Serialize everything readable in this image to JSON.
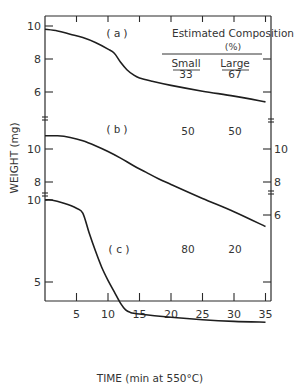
{
  "chart_data": {
    "type": "line",
    "title": "",
    "xlabel": "TIME (min at 550°C)",
    "ylabel": "WEIGHT (mg)",
    "x_ticks": [
      5,
      10,
      15,
      20,
      25,
      30,
      35
    ],
    "xlim": [
      0,
      35
    ],
    "grid": false,
    "legend": {
      "header": "Estimated Composition",
      "unit": "(%)",
      "columns": [
        "Small",
        "Large"
      ]
    },
    "panels": [
      {
        "label": "(a)",
        "composition": {
          "small": "33",
          "large": "67"
        },
        "left_ticks": [
          10,
          8,
          6
        ],
        "right_ticks": [],
        "ylim": [
          4.5,
          10.5
        ],
        "x": [
          0,
          2,
          4,
          6,
          8,
          10,
          11,
          12,
          13,
          14,
          15,
          17,
          20,
          25,
          30,
          35
        ],
        "y": [
          9.8,
          9.7,
          9.5,
          9.3,
          9.0,
          8.6,
          8.35,
          7.8,
          7.35,
          7.05,
          6.85,
          6.65,
          6.4,
          6.05,
          5.75,
          5.4
        ]
      },
      {
        "label": "(b)",
        "composition": {
          "small": "50",
          "large": "50"
        },
        "left_ticks": [
          10,
          8
        ],
        "right_ticks": [
          10,
          8,
          6
        ],
        "ylim": [
          7.5,
          11.5
        ],
        "x": [
          0,
          2,
          4,
          6,
          8,
          10,
          12,
          14,
          16,
          18,
          20,
          25,
          30,
          35
        ],
        "y": [
          10.8,
          10.8,
          10.7,
          10.5,
          10.2,
          9.85,
          9.45,
          9.0,
          8.6,
          8.2,
          7.85,
          7.0,
          6.2,
          5.3
        ]
      },
      {
        "label": "(c)",
        "composition": {
          "small": "80",
          "large": "20"
        },
        "left_ticks": [
          10,
          5
        ],
        "right_ticks": [],
        "ylim": [
          3,
          10.5
        ],
        "x": [
          0,
          1,
          3,
          5,
          6,
          7,
          8,
          9,
          10,
          11,
          12,
          12.8,
          13.5,
          15,
          20,
          25,
          30,
          35
        ],
        "y": [
          10.0,
          10.0,
          9.8,
          9.5,
          9.2,
          8.0,
          6.9,
          5.9,
          5.1,
          4.4,
          3.7,
          3.3,
          3.15,
          3.05,
          2.85,
          2.7,
          2.6,
          2.55
        ]
      }
    ]
  }
}
